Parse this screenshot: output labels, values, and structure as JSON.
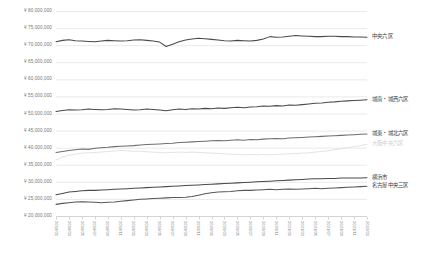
{
  "chart_data": {
    "type": "line",
    "title": "",
    "subtitle": "",
    "xlabel": "",
    "ylabel": "",
    "ylim": [
      20000000,
      80000000
    ],
    "ytick_step": 5000000,
    "grid": true,
    "legend_position": "right-inline",
    "ytick_labels": [
      "¥ 80,000,000",
      "¥ 75,000,000",
      "¥ 70,000,000",
      "¥ 65,000,000",
      "¥ 60,000,000",
      "¥ 55,000,000",
      "¥ 50,000,000",
      "¥ 45,000,000",
      "¥ 40,000,000",
      "¥ 35,000,000",
      "¥ 30,000,000",
      "¥ 25,000,000",
      "¥ 20,000,000"
    ],
    "ytick_values": [
      80000000,
      75000000,
      70000000,
      65000000,
      60000000,
      55000000,
      50000000,
      45000000,
      40000000,
      35000000,
      30000000,
      25000000,
      20000000
    ],
    "categories": [
      "2018/01",
      "2018/02",
      "2018/03",
      "2018/04",
      "2018/05",
      "2018/06",
      "2018/07",
      "2018/08",
      "2018/09",
      "2018/10",
      "2018/11",
      "2018/12",
      "2019/01",
      "2019/02",
      "2019/03",
      "2019/04",
      "2019/05",
      "2019/06",
      "2019/07",
      "2019/08",
      "2019/09",
      "2019/10",
      "2019/11",
      "2019/12",
      "2020/01",
      "2020/02",
      "2020/03",
      "2020/04",
      "2020/05",
      "2020/06",
      "2020/07",
      "2020/08",
      "2020/09",
      "2020/10",
      "2020/11",
      "2020/12",
      "2021/01",
      "2021/02",
      "2021/03",
      "2021/04",
      "2021/05",
      "2021/06",
      "2021/07",
      "2021/08",
      "2021/09",
      "2021/10",
      "2021/11",
      "2021/12",
      "2022/01"
    ],
    "xtick_labels": [
      "2018/01",
      "2018/03",
      "2018/05",
      "2018/07",
      "2018/09",
      "2018/11",
      "2019/01",
      "2019/03",
      "2019/05",
      "2019/07",
      "2019/09",
      "2019/11",
      "2020/01",
      "2020/03",
      "2020/05",
      "2020/07",
      "2020/09",
      "2020/11",
      "2021/01",
      "2021/03",
      "2021/05",
      "2021/07",
      "2021/09",
      "2021/11",
      "2022/01"
    ],
    "series": [
      {
        "name": "中央六区",
        "color": "#4a4a4a",
        "label_color": "#3d3d3d",
        "values": [
          71000000,
          71400000,
          71600000,
          71300000,
          71200000,
          71100000,
          71000000,
          71200000,
          71400000,
          71300000,
          71200000,
          71300000,
          71500000,
          71600000,
          71400000,
          71200000,
          70900000,
          69600000,
          70300000,
          71000000,
          71500000,
          71800000,
          72000000,
          71900000,
          71700000,
          71500000,
          71300000,
          71200000,
          71400000,
          71300000,
          71200000,
          71400000,
          71800000,
          72500000,
          72300000,
          72400000,
          72600000,
          72800000,
          72700000,
          72600000,
          72500000,
          72500000,
          72600000,
          72600000,
          72500000,
          72500000,
          72400000,
          72400000,
          72300000
        ]
      },
      {
        "name": "城南・城西六区",
        "color": "#4a4a4a",
        "label_color": "#3d3d3d",
        "values": [
          50600000,
          50900000,
          51100000,
          51000000,
          51100000,
          51300000,
          51200000,
          51100000,
          51200000,
          51400000,
          51300000,
          51200000,
          51000000,
          51100000,
          51300000,
          51200000,
          51000000,
          50800000,
          51100000,
          51300000,
          51200000,
          51400000,
          51300000,
          51500000,
          51400000,
          51600000,
          51500000,
          51700000,
          51800000,
          51700000,
          51900000,
          52000000,
          52200000,
          52100000,
          52300000,
          52200000,
          52500000,
          52400000,
          52600000,
          52800000,
          53000000,
          53100000,
          53300000,
          53400000,
          53600000,
          53700000,
          53800000,
          53900000,
          54000000
        ]
      },
      {
        "name": "城東・城北六区",
        "color": "#6e6e6e",
        "label_color": "#3d3d3d",
        "values": [
          38600000,
          38900000,
          39200000,
          39400000,
          39600000,
          39500000,
          39800000,
          40000000,
          40100000,
          40300000,
          40400000,
          40500000,
          40600000,
          40800000,
          40900000,
          41000000,
          41100000,
          41200000,
          41300000,
          41500000,
          41600000,
          41700000,
          41800000,
          41900000,
          42000000,
          42100000,
          42000000,
          42200000,
          42300000,
          42200000,
          42400000,
          42300000,
          42500000,
          42600000,
          42700000,
          42600000,
          42800000,
          42900000,
          43000000,
          43100000,
          43200000,
          43300000,
          43400000,
          43500000,
          43600000,
          43700000,
          43800000,
          43900000,
          44000000
        ]
      },
      {
        "name": "大阪中央六区",
        "color": "#dcdcdc",
        "label_color": "#cfcfcf",
        "values": [
          36400000,
          37200000,
          37800000,
          38100000,
          38400000,
          38500000,
          38600000,
          38700000,
          38900000,
          39000000,
          39200000,
          39100000,
          38900000,
          39000000,
          38800000,
          38700000,
          38600000,
          38500000,
          38600000,
          38700000,
          38600000,
          38700000,
          38600000,
          38500000,
          38400000,
          38300000,
          38200000,
          38100000,
          38000000,
          37900000,
          38000000,
          37900000,
          38000000,
          37900000,
          38000000,
          38100000,
          38200000,
          38300000,
          38400000,
          38500000,
          38700000,
          38900000,
          39100000,
          39400000,
          39700000,
          40000000,
          40300000,
          40600000,
          41000000
        ]
      },
      {
        "name": "横浜市",
        "color": "#4a4a4a",
        "label_color": "#3d3d3d",
        "values": [
          26200000,
          26600000,
          27000000,
          27200000,
          27400000,
          27500000,
          27500000,
          27600000,
          27700000,
          27800000,
          27900000,
          28000000,
          28100000,
          28200000,
          28300000,
          28400000,
          28500000,
          28600000,
          28700000,
          28800000,
          28900000,
          29000000,
          29100000,
          29200000,
          29300000,
          29400000,
          29500000,
          29600000,
          29700000,
          29800000,
          29900000,
          30000000,
          30100000,
          30200000,
          30300000,
          30400000,
          30500000,
          30600000,
          30700000,
          30800000,
          30900000,
          30900000,
          31000000,
          31000000,
          31100000,
          31100000,
          31100000,
          31100000,
          31200000
        ]
      },
      {
        "name": "名古屋中央三区",
        "color": "#565656",
        "label_color": "#3d3d3d",
        "values": [
          23400000,
          23700000,
          23900000,
          24100000,
          24200000,
          24100000,
          24000000,
          23900000,
          24000000,
          24100000,
          24300000,
          24500000,
          24700000,
          24900000,
          25000000,
          25100000,
          25200000,
          25300000,
          25400000,
          25400000,
          25500000,
          25700000,
          26100000,
          26500000,
          26800000,
          27000000,
          27100000,
          27200000,
          27400000,
          27500000,
          27500000,
          27600000,
          27700000,
          27800000,
          27700000,
          27800000,
          27900000,
          27800000,
          27900000,
          28000000,
          28100000,
          28000000,
          28100000,
          28200000,
          28300000,
          28400000,
          28500000,
          28600000,
          28700000
        ]
      }
    ]
  },
  "axis_colors": {
    "grid": "#eaeaea",
    "axis_line": "#d4d4d4",
    "tick_text": "#767676"
  }
}
